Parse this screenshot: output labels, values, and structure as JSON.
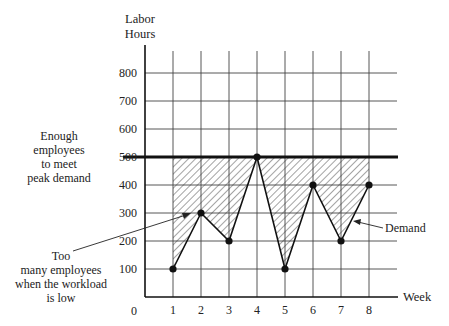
{
  "chart_data": {
    "type": "line",
    "title": "",
    "xlabel": "Week",
    "ylabel": "Labor Hours",
    "ylabel_lines": [
      "Labor",
      "Hours"
    ],
    "x": [
      1,
      2,
      3,
      4,
      5,
      6,
      7,
      8
    ],
    "x_ticks": [
      "1",
      "2",
      "3",
      "4",
      "5",
      "6",
      "7",
      "8"
    ],
    "x_origin_label": "0",
    "y_ticks": [
      "100",
      "200",
      "300",
      "400",
      "500",
      "600",
      "700",
      "800"
    ],
    "ylim": [
      0,
      800
    ],
    "grid": true,
    "series": [
      {
        "name": "Demand",
        "values": [
          100,
          300,
          200,
          500,
          100,
          400,
          200,
          400
        ]
      }
    ],
    "capacity_level": 500,
    "annotations": [
      {
        "text_lines": [
          "Enough",
          "employees",
          "to meet",
          "peak demand"
        ],
        "points_to": "500 level line"
      },
      {
        "text_lines": [
          "Too",
          "many employees",
          "when the workload",
          "is low"
        ],
        "points_to": "hatched area between 500 and demand"
      },
      {
        "text_lines": [
          "Demand"
        ],
        "points_to": "demand line"
      }
    ]
  }
}
